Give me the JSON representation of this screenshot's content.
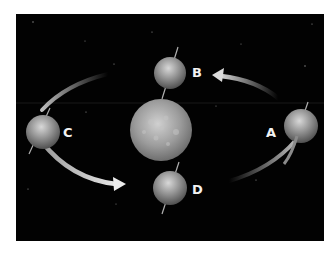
{
  "diagram": {
    "type": "earth-orbit-around-sun",
    "colors": {
      "background": "#020202",
      "page": "#ffffff",
      "arrow": "#c8c8c8",
      "label": "#f2f2f2",
      "sun": "#9a9a9a",
      "earth": "#8a8a8a"
    },
    "center_body": "sun",
    "positions": [
      {
        "id": "A",
        "label": "A"
      },
      {
        "id": "B",
        "label": "B"
      },
      {
        "id": "C",
        "label": "C"
      },
      {
        "id": "D",
        "label": "D"
      }
    ],
    "arrows": [
      {
        "from": "A",
        "to": "B"
      },
      {
        "from": "C",
        "to": "D"
      }
    ]
  }
}
